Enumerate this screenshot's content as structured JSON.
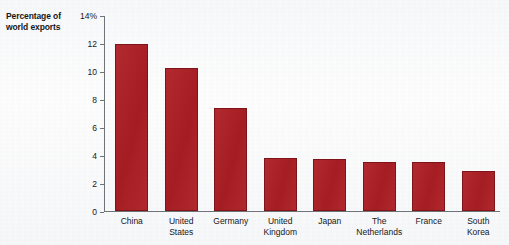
{
  "chart_data": {
    "type": "bar",
    "title": "",
    "subtitle": "",
    "ylabel": "Percentage of world exports",
    "xlabel": "",
    "categories": [
      "China",
      "United States",
      "Germany",
      "United Kingdom",
      "Japan",
      "The Netherlands",
      "France",
      "South Korea"
    ],
    "values": [
      12.0,
      10.3,
      7.4,
      3.8,
      3.7,
      3.5,
      3.5,
      2.85
    ],
    "series": [
      {
        "name": "Percentage of world exports",
        "values": [
          12.0,
          10.3,
          7.4,
          3.8,
          3.7,
          3.5,
          3.5,
          2.85
        ]
      }
    ],
    "ylim": [
      0,
      14
    ],
    "yticks": [
      0,
      2,
      4,
      6,
      8,
      10,
      12,
      14
    ],
    "ytick_labels": [
      "0",
      "2",
      "4",
      "6",
      "8",
      "10",
      "12",
      "14%"
    ],
    "grid": false,
    "legend": false,
    "legend_position": "none",
    "bar_color": "#ae1f25",
    "bar_border_color": "#7e1418",
    "axis_color": "#6e7478",
    "background_color": "#fbfcfd",
    "text_color": "#15171a"
  },
  "axis_title": {
    "line1": "Percentage of",
    "line2": "world exports"
  },
  "category_labels": [
    "China",
    "United\nStates",
    "Germany",
    "United\nKingdom",
    "Japan",
    "The\nNetherlands",
    "France",
    "South\nKorea"
  ]
}
